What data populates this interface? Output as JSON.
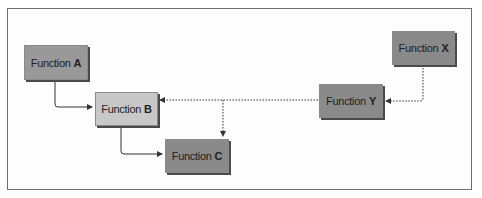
{
  "diagram": {
    "nodes": [
      {
        "id": "A",
        "prefix": "Function",
        "letter": "A",
        "shade": "#939393"
      },
      {
        "id": "B",
        "prefix": "Function",
        "letter": "B",
        "shade": "#c8c8c8"
      },
      {
        "id": "C",
        "prefix": "Function",
        "letter": "C",
        "shade": "#878787"
      },
      {
        "id": "X",
        "prefix": "Function",
        "letter": "X",
        "shade": "#8a8a8a"
      },
      {
        "id": "Y",
        "prefix": "Function",
        "letter": "Y",
        "shade": "#878787"
      }
    ],
    "edges": [
      {
        "from": "A",
        "to": "B",
        "style": "solid"
      },
      {
        "from": "B",
        "to": "C",
        "style": "solid"
      },
      {
        "from": "X",
        "to": "Y",
        "style": "dotted"
      },
      {
        "from": "Y",
        "to": "B",
        "style": "dotted"
      },
      {
        "from": "Y",
        "to": "C",
        "style": "dotted"
      }
    ]
  }
}
